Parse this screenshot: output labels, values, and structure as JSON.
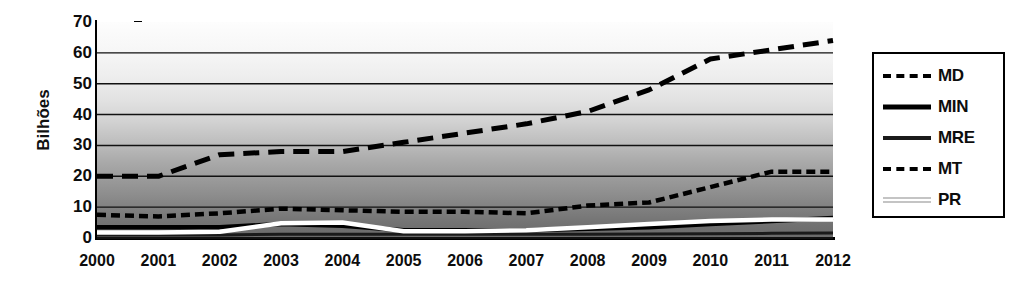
{
  "chart_data": {
    "type": "line",
    "title": "",
    "xlabel": "",
    "ylabel": "Bilhões",
    "ylim": [
      0,
      70
    ],
    "ytick_values": [
      0,
      10,
      20,
      30,
      40,
      50,
      60,
      70
    ],
    "ytick_labels": [
      "0",
      "10",
      "20",
      "30",
      "40",
      "50",
      "60",
      "70"
    ],
    "grid": "horizontal",
    "legend_position": "right-outside",
    "categories": [
      "2000",
      "2001",
      "2002",
      "2003",
      "2004",
      "2005",
      "2006",
      "2007",
      "2008",
      "2009",
      "2010",
      "2011",
      "2012"
    ],
    "series": [
      {
        "name": "MD",
        "style": "long-dashed",
        "color": "#000000",
        "values": [
          20,
          20,
          27,
          28,
          28,
          31,
          34,
          37,
          41,
          48,
          58,
          61,
          64
        ]
      },
      {
        "name": "MIN",
        "style": "solid-thick",
        "color": "#000000",
        "values": [
          3.5,
          3.5,
          3.5,
          4.5,
          4.0,
          2.5,
          2.5,
          2.5,
          3.0,
          3.5,
          4.5,
          5.5,
          6.5
        ]
      },
      {
        "name": "MRE",
        "style": "solid",
        "color": "#1a1a1a",
        "values": [
          1.0,
          1.0,
          1.0,
          1.2,
          1.2,
          1.2,
          1.2,
          1.2,
          1.2,
          1.3,
          1.4,
          1.5,
          1.6
        ]
      },
      {
        "name": "MT",
        "style": "short-dashed",
        "color": "#000000",
        "values": [
          7.5,
          7.0,
          8.0,
          9.5,
          9.0,
          8.5,
          8.5,
          8.0,
          10.5,
          11.5,
          16.5,
          21.5,
          21.5
        ]
      },
      {
        "name": "PR",
        "style": "solid-white",
        "color": "#ffffff",
        "values": [
          1.8,
          1.8,
          2.0,
          4.8,
          5.0,
          2.2,
          2.2,
          2.5,
          3.5,
          4.5,
          5.5,
          6.0,
          6.0
        ]
      }
    ]
  },
  "legend": {
    "items": [
      {
        "label": "MD",
        "sample_class": "s-md"
      },
      {
        "label": "MIN",
        "sample_class": "s-min"
      },
      {
        "label": "MRE",
        "sample_class": "s-mre"
      },
      {
        "label": "MT",
        "sample_class": "s-mt"
      },
      {
        "label": "PR",
        "sample_class": "s-pr"
      }
    ]
  }
}
